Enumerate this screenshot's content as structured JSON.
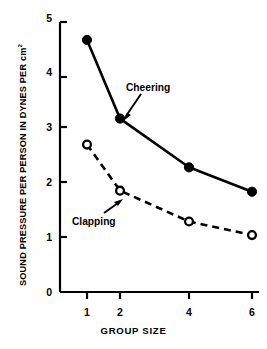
{
  "figure": {
    "title": "",
    "ylabel_main": "SOUND PRESSURE PER PERSON IN DYNES PER cm",
    "ylabel_exponent": "2",
    "xlabel": "GROUP SIZE",
    "ink_color": "#000000",
    "background_color": "#ffffff"
  },
  "axes": {
    "y_ticks": [
      "0",
      "1",
      "2",
      "3",
      "4",
      "5"
    ],
    "x_ticks": [
      "1",
      "2",
      "4",
      "6"
    ]
  },
  "annotations": {
    "cheering_label": "Cheering",
    "clapping_label": "Clapping"
  },
  "chart_data": {
    "type": "line",
    "title": "",
    "xlabel": "GROUP SIZE",
    "ylabel": "SOUND PRESSURE PER PERSON IN DYNES PER cm2",
    "x": [
      1,
      2,
      4,
      6
    ],
    "categories": [
      "1",
      "2",
      "4",
      "6"
    ],
    "xlim": [
      0,
      3
    ],
    "ylim": [
      0,
      5
    ],
    "x_tick_labels": [
      "1",
      "2",
      "4",
      "6"
    ],
    "y_tick_labels": [
      "0",
      "1",
      "2",
      "3",
      "4",
      "5"
    ],
    "grid": false,
    "legend": "inline-annotations",
    "series": [
      {
        "name": "Cheering",
        "values": [
          4.65,
          3.2,
          2.3,
          1.85
        ],
        "marker": "filled-circle",
        "linestyle": "solid",
        "color": "#000000"
      },
      {
        "name": "Clapping",
        "values": [
          2.72,
          1.87,
          1.3,
          1.05
        ],
        "marker": "open-circle",
        "linestyle": "dashed",
        "color": "#000000"
      }
    ]
  }
}
